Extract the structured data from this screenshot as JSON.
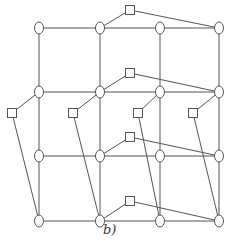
{
  "figure": {
    "label": "b)",
    "stroke": "#555555",
    "circles": [
      {
        "id": "c00",
        "x": 39,
        "y": 28
      },
      {
        "id": "c01",
        "x": 100,
        "y": 28
      },
      {
        "id": "c02",
        "x": 160,
        "y": 28
      },
      {
        "id": "c03",
        "x": 219,
        "y": 28
      },
      {
        "id": "c10",
        "x": 39,
        "y": 92
      },
      {
        "id": "c11",
        "x": 100,
        "y": 92
      },
      {
        "id": "c12",
        "x": 160,
        "y": 92
      },
      {
        "id": "c13",
        "x": 219,
        "y": 92
      },
      {
        "id": "c20",
        "x": 39,
        "y": 156
      },
      {
        "id": "c21",
        "x": 100,
        "y": 156
      },
      {
        "id": "c22",
        "x": 160,
        "y": 156
      },
      {
        "id": "c23",
        "x": 219,
        "y": 156
      },
      {
        "id": "c30",
        "x": 39,
        "y": 221
      },
      {
        "id": "c31",
        "x": 100,
        "y": 221
      },
      {
        "id": "c32",
        "x": 160,
        "y": 221
      },
      {
        "id": "c33",
        "x": 219,
        "y": 221
      }
    ],
    "squares": [
      {
        "id": "s_top",
        "x": 130,
        "y": 10
      },
      {
        "id": "s_mid",
        "x": 130,
        "y": 73
      },
      {
        "id": "s_a",
        "x": 12,
        "y": 113
      },
      {
        "id": "s_b",
        "x": 73,
        "y": 113
      },
      {
        "id": "s_c",
        "x": 138,
        "y": 113
      },
      {
        "id": "s_d",
        "x": 193,
        "y": 113
      },
      {
        "id": "s_row3",
        "x": 130,
        "y": 137
      },
      {
        "id": "s_bot",
        "x": 130,
        "y": 201
      }
    ],
    "edges": [
      [
        "c00",
        "c01"
      ],
      [
        "c01",
        "c02"
      ],
      [
        "c02",
        "c03"
      ],
      [
        "c10",
        "c11"
      ],
      [
        "c11",
        "c12"
      ],
      [
        "c12",
        "c13"
      ],
      [
        "c20",
        "c21"
      ],
      [
        "c21",
        "c22"
      ],
      [
        "c22",
        "c23"
      ],
      [
        "c30",
        "c31"
      ],
      [
        "c31",
        "c32"
      ],
      [
        "c32",
        "c33"
      ],
      [
        "c00",
        "c10"
      ],
      [
        "c10",
        "c20"
      ],
      [
        "c20",
        "c30"
      ],
      [
        "c01",
        "c11"
      ],
      [
        "c11",
        "c21"
      ],
      [
        "c21",
        "c31"
      ],
      [
        "c02",
        "c12"
      ],
      [
        "c12",
        "c22"
      ],
      [
        "c22",
        "c32"
      ],
      [
        "c03",
        "c13"
      ],
      [
        "c13",
        "c23"
      ],
      [
        "c23",
        "c33"
      ],
      [
        "c01",
        "s_top"
      ],
      [
        "s_top",
        "c03"
      ],
      [
        "c11",
        "s_mid"
      ],
      [
        "s_mid",
        "c13"
      ],
      [
        "c21",
        "s_row3"
      ],
      [
        "s_row3",
        "c23"
      ],
      [
        "c31",
        "s_bot"
      ],
      [
        "s_bot",
        "c33"
      ],
      [
        "c10",
        "s_a"
      ],
      [
        "s_a",
        "c30"
      ],
      [
        "c11",
        "s_b"
      ],
      [
        "s_b",
        "c31"
      ],
      [
        "c12",
        "s_c"
      ],
      [
        "s_c",
        "c32"
      ],
      [
        "c13",
        "s_d"
      ],
      [
        "s_d",
        "c33"
      ]
    ]
  }
}
